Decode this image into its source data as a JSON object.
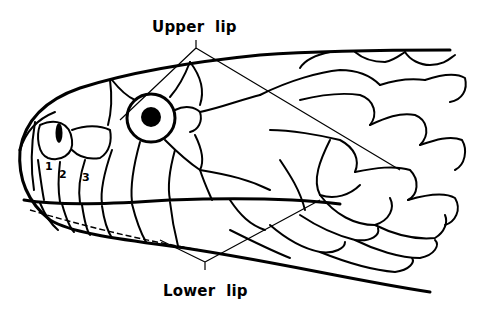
{
  "figure": {
    "labels": {
      "upper": "Upper  lip",
      "lower": "Lower  lip"
    },
    "scale_numbers": [
      "1",
      "2",
      "3"
    ]
  }
}
